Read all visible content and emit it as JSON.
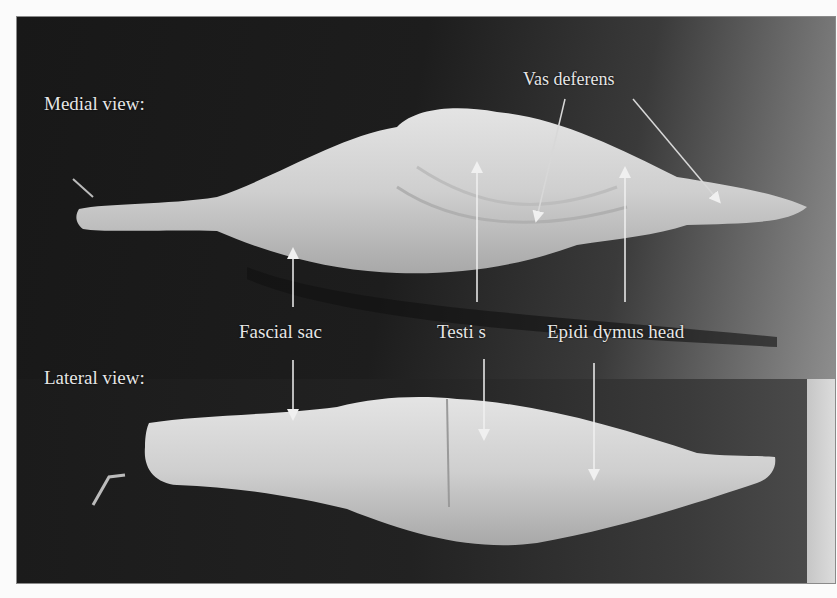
{
  "figure": {
    "views": {
      "medial": "Medial view:",
      "lateral": "Lateral view:"
    },
    "annotations": {
      "vas_deferens": "Vas deferens",
      "fascial_sac": "Fascial sac",
      "testis": "Testi s",
      "epididymus_head": "Epidi dymus head"
    },
    "colors": {
      "background_dark": "#1b1b1b",
      "specimen": "#d9d9d9",
      "label_text": "#e6e6e6",
      "arrow": "#f0f0f0"
    }
  }
}
